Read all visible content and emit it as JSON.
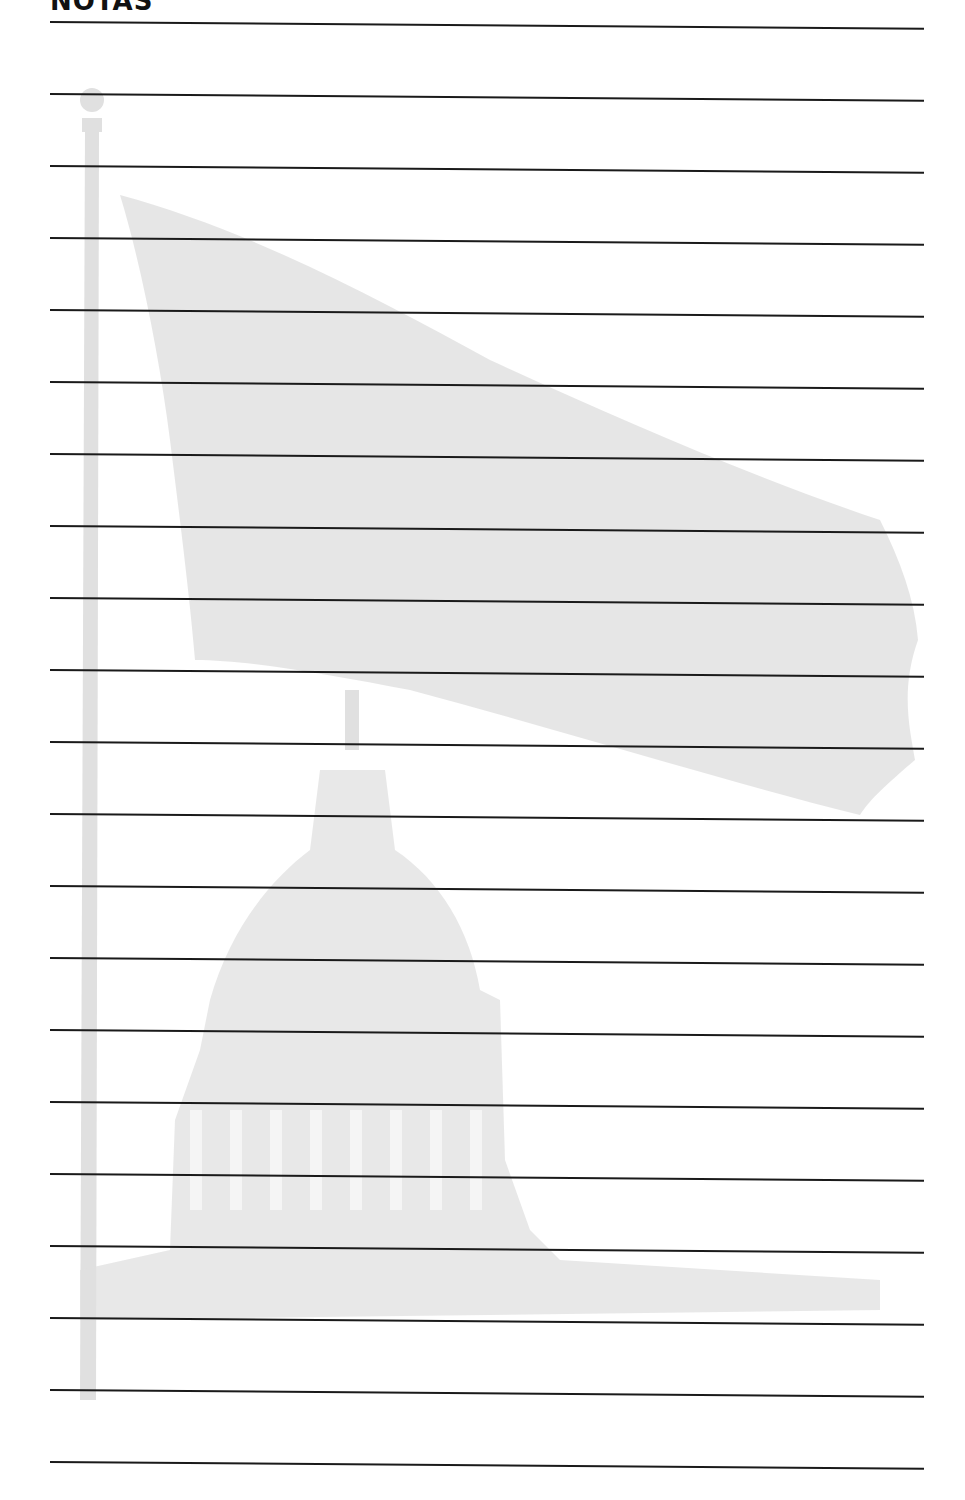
{
  "page": {
    "title": "NOTAS",
    "line_count": 21,
    "line_color": "#1a1a1a",
    "watermark": {
      "description": "Faded American flag on flagpole above the U.S. Capitol dome",
      "color": "#dcdcdc"
    }
  }
}
